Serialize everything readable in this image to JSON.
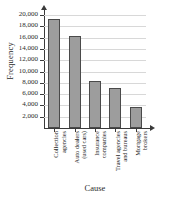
{
  "chart_data": {
    "type": "bar",
    "title": "",
    "xlabel": "Cause",
    "ylabel": "Frequency",
    "categories": [
      "Collection agencies",
      "Auto dealers (used cars)",
      "Insurance companies",
      "Travel agencies and bureaus",
      "Mortgage brokers"
    ],
    "category_lines": [
      [
        "Collection",
        "agencies"
      ],
      [
        "Auto dealers",
        "(used cars)"
      ],
      [
        "Insurance",
        "companies"
      ],
      [
        "Travel agencies",
        "and bureaus"
      ],
      [
        "Mortgage",
        "brokers"
      ]
    ],
    "values": [
      19300,
      16300,
      8400,
      7000,
      3700
    ],
    "ylim": [
      0,
      20000
    ],
    "ytick_values": [
      2000,
      4000,
      6000,
      8000,
      10000,
      12000,
      14000,
      16000,
      18000,
      20000
    ],
    "ytick_labels": [
      "2,000",
      "4,000",
      "6,000",
      "8,000",
      "10,000",
      "12,000",
      "14,000",
      "16,000",
      "18,000",
      "20,000"
    ],
    "grid": true,
    "legend": "none",
    "bar_fill_color": "#9d9d9d",
    "bar_edge_color": "#4a4a4a",
    "axis_color": "#3a3a3a",
    "grid_color": "#d8d8d8"
  }
}
